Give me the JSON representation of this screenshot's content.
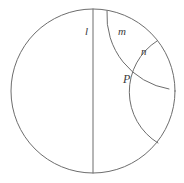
{
  "figure": {
    "kind": "poincare-disk-diagram",
    "background_color": "#ffffff",
    "stroke_color": "#6d6d6d",
    "label_color": "#3a3a3a",
    "canvas": {
      "width": 184,
      "height": 183
    },
    "boundary_circle": {
      "name": "boundary-circle",
      "center_x": 93,
      "center_y": 91,
      "radius": 82
    },
    "labels": {
      "line_l": "l",
      "line_m": "m",
      "line_n": "n",
      "point_P": "P"
    },
    "elements": {
      "diameter_line": {
        "name": "hyperbolic-line-l",
        "x1": 93,
        "y1": 9,
        "x2": 93,
        "y2": 173
      },
      "arc_m": {
        "name": "hyperbolic-line-m",
        "start_x": 107,
        "start_y": 11,
        "end_x": 169,
        "end_y": 89,
        "radius": 74,
        "sweep": 0
      },
      "arc_n": {
        "name": "hyperbolic-line-n",
        "start_x": 157,
        "start_y": 41,
        "end_x": 158,
        "end_y": 143,
        "radius": 60,
        "sweep": 0
      }
    },
    "point_P": {
      "name": "intersection-point-P",
      "x": 133,
      "y": 80
    }
  }
}
